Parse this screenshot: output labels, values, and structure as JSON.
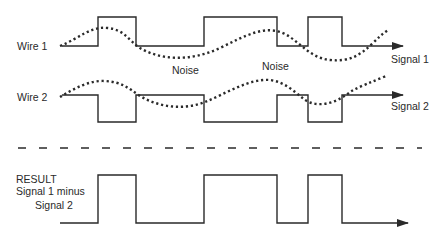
{
  "labels": {
    "wire1": "Wire 1",
    "wire2": "Wire 2",
    "noise_left": "Noise",
    "noise_right": "Noise",
    "signal1": "Signal 1",
    "signal2": "Signal 2",
    "result_line1": "RESULT",
    "result_line2": "Signal 1 minus",
    "result_line3": "Signal 2"
  },
  "colors": {
    "line": "#2a2a2a",
    "background": "#ffffff"
  },
  "waveforms": {
    "wire1_transitions_x": [
      98,
      136,
      204,
      277,
      308,
      342
    ],
    "wire2_transitions_x": [
      98,
      136,
      204,
      277,
      308,
      342
    ],
    "result_transitions_x": [
      98,
      136,
      204,
      277,
      308,
      342
    ]
  }
}
